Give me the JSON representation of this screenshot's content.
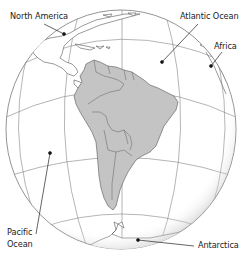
{
  "map": {
    "title": "South America orthographic globe",
    "colors": {
      "background": "#ffffff",
      "ocean": "#ffffff",
      "land_focus": "#c4c4c4",
      "land_other": "#ffffff",
      "outline": "#555555",
      "graticule": "#777777",
      "leader": "#222222"
    },
    "labels": [
      {
        "id": "north-america",
        "text": "North America",
        "x": 10,
        "y": 12,
        "dot": [
          64,
          34
        ]
      },
      {
        "id": "atlantic-ocean",
        "text": "Atlantic Ocean",
        "x": 180,
        "y": 12,
        "dot": [
          162,
          62
        ]
      },
      {
        "id": "africa",
        "text": "Africa",
        "x": 214,
        "y": 42,
        "dot": [
          211,
          66
        ]
      },
      {
        "id": "pacific-ocean-1",
        "text": "Pacific",
        "x": 7,
        "y": 228,
        "dot": [
          50,
          153
        ]
      },
      {
        "id": "pacific-ocean-2",
        "text": "Ocean",
        "x": 7,
        "y": 240
      },
      {
        "id": "antarctica",
        "text": "Antarctica",
        "x": 198,
        "y": 241,
        "dot": [
          138,
          240
        ]
      }
    ]
  }
}
